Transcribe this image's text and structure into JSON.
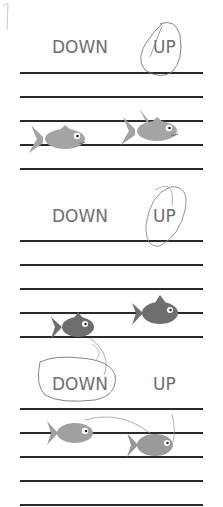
{
  "worksheet": {
    "sections": [
      {
        "labels": {
          "left": "DOWN",
          "right": "UP"
        },
        "circled": "UP",
        "description": "First fish faces right on lower line, second fish is higher — answer UP"
      },
      {
        "labels": {
          "left": "DOWN",
          "right": "UP"
        },
        "circled": "UP",
        "description": "Second fish is higher than first — answer UP"
      },
      {
        "labels": {
          "left": "DOWN",
          "right": "UP"
        },
        "circled": "DOWN",
        "description": "Second fish is lower than first — answer DOWN"
      }
    ],
    "corner_mark": "1",
    "colors": {
      "line": "#2a2a2a",
      "text": "#6e6e6e",
      "fish_light": "#a8a8a8",
      "fish_dark": "#6a6a6a",
      "pencil": "#8a8a8a"
    }
  }
}
